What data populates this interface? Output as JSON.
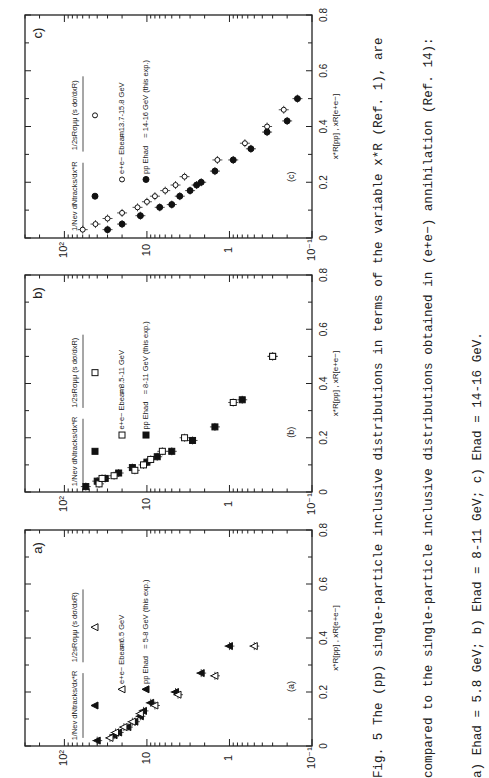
{
  "figure": {
    "number": "Fig. 5",
    "caption_lines": [
      "Fig. 5 The (pp) single-particle inclusive distributions in terms of the variable x*R (Ref. 1), are",
      "compared to the single-particle inclusive distributions obtained in (e+e−) annihilation (Ref. 14):",
      "a) Ehad = 5.8 GeV; b) Ehad = 8-11 GeV; c) Ehad = 14-16 GeV."
    ]
  },
  "chart_data": [
    {
      "type": "scatter",
      "panel": "a)",
      "panel_tag": "(a)",
      "xlabel": "x*R[pp] , xR[e+e−]",
      "ylabel": "",
      "xlim": [
        0,
        0.8
      ],
      "ylim": [
        0.1,
        300
      ],
      "yscale": "log",
      "xticks": [
        "0",
        "0.2",
        "0.4",
        "0.6",
        "0.8"
      ],
      "yticks": [
        "10⁻¹",
        "1",
        "10",
        "10²"
      ],
      "legend_formula_left": "1/Nev dNtracks/dx*R",
      "legend_formula_right": "1/2sRσμμ (s dσ/dxR)",
      "legend": [
        {
          "marker": "open-triangle",
          "label": "e+e− Ebeam",
          "value": "= 6.5 GeV"
        },
        {
          "marker": "filled-triangle",
          "label": "pp Ehad",
          "value": "= 5-8 GeV (this exp.)"
        }
      ],
      "series": [
        {
          "name": "pp Ehad 5-8 GeV",
          "marker": "filled-triangle",
          "x": [
            0.02,
            0.04,
            0.05,
            0.07,
            0.09,
            0.11,
            0.13,
            0.16,
            0.2,
            0.27,
            0.37
          ],
          "y": [
            40,
            25,
            22,
            17,
            14,
            12,
            11,
            9,
            4.5,
            2.2,
            1.0
          ]
        },
        {
          "name": "e+e− Ebeam 6.5 GeV",
          "marker": "open-triangle",
          "x": [
            0.03,
            0.05,
            0.07,
            0.09,
            0.12,
            0.15,
            0.19,
            0.26,
            0.37
          ],
          "y": [
            28,
            24,
            19,
            15,
            12,
            8,
            4.2,
            1.5,
            0.5
          ]
        }
      ]
    },
    {
      "type": "scatter",
      "panel": "b)",
      "panel_tag": "(b)",
      "xlabel": "x*R[pp] , xR[e+e−]",
      "xlim": [
        0,
        0.8
      ],
      "ylim": [
        0.1,
        300
      ],
      "yscale": "log",
      "xticks": [
        "0",
        "0.2",
        "0.4",
        "0.6",
        "0.8"
      ],
      "yticks": [
        "10⁻¹",
        "1",
        "10",
        "10²"
      ],
      "legend_formula_left": "1/Nev dNtracks/dx*R",
      "legend_formula_right": "1/2sRσμμ (s dσ/dxR)",
      "legend": [
        {
          "marker": "open-square",
          "label": "e+e− Ebeam",
          "value": "= 8.5-11 GeV"
        },
        {
          "marker": "filled-square",
          "label": "pp Ehad",
          "value": "= 8-11 GeV (this exp.)"
        }
      ],
      "series": [
        {
          "name": "pp Ehad 8-11 GeV",
          "marker": "filled-square",
          "x": [
            0.02,
            0.04,
            0.05,
            0.07,
            0.09,
            0.11,
            0.13,
            0.15,
            0.19,
            0.24,
            0.34,
            0.5
          ],
          "y": [
            55,
            40,
            32,
            22,
            15,
            10,
            7.5,
            5,
            2.8,
            1.5,
            0.7,
            0.3
          ]
        },
        {
          "name": "e+e− Ebeam 8.5-11 GeV",
          "marker": "open-square",
          "x": [
            0.03,
            0.05,
            0.06,
            0.08,
            0.1,
            0.12,
            0.15,
            0.2,
            0.33,
            0.5
          ],
          "y": [
            38,
            35,
            25,
            14,
            11,
            9,
            6.5,
            3.5,
            0.9,
            0.3
          ]
        }
      ]
    },
    {
      "type": "scatter",
      "panel": "c)",
      "panel_tag": "(c)",
      "xlabel": "x*R[pp] , xR[e+e−]",
      "xlim": [
        0,
        0.8
      ],
      "ylim": [
        0.1,
        300
      ],
      "yscale": "log",
      "xticks": [
        "0",
        "0.2",
        "0.4",
        "0.6",
        "0.8"
      ],
      "yticks": [
        "10⁻¹",
        "1",
        "10",
        "10²"
      ],
      "legend_formula_left": "1/Nev dNtracks/dx*R",
      "legend_formula_right": "1/2sRσμμ (s dσ/dxR)",
      "legend": [
        {
          "marker": "open-circle",
          "label": "e+e− Ebeam",
          "value": "= 13.7-15.8 GeV"
        },
        {
          "marker": "filled-circle",
          "label": "pp Ehad",
          "value": "= 14-16 GeV (this exp.)"
        }
      ],
      "series": [
        {
          "name": "pp Ehad 14-16 GeV",
          "marker": "filled-circle",
          "x": [
            0.03,
            0.05,
            0.08,
            0.11,
            0.12,
            0.15,
            0.17,
            0.19,
            0.2,
            0.24,
            0.28,
            0.32,
            0.38,
            0.42,
            0.5
          ],
          "y": [
            30,
            20,
            12,
            7,
            5,
            4,
            3,
            2.5,
            2.2,
            1.5,
            0.9,
            0.55,
            0.35,
            0.2,
            0.15
          ]
        },
        {
          "name": "e+e− Ebeam 13.7-15.8 GeV",
          "marker": "open-circle",
          "x": [
            0.03,
            0.05,
            0.07,
            0.09,
            0.11,
            0.13,
            0.15,
            0.17,
            0.19,
            0.22,
            0.28,
            0.34,
            0.4,
            0.46
          ],
          "y": [
            60,
            42,
            30,
            20,
            13,
            10,
            8,
            6,
            4.5,
            3.5,
            1.4,
            0.65,
            0.35,
            0.22
          ]
        }
      ]
    }
  ]
}
